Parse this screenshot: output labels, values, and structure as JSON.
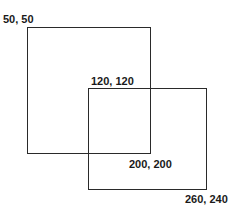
{
  "diagram": {
    "colors": {
      "stroke": "#2a2a2a",
      "text": "#1a1a1a",
      "background": "#ffffff"
    },
    "rectangles": [
      {
        "name": "rect-a",
        "top_left_label": "50, 50",
        "bottom_right_label": "200, 200",
        "box": {
          "left": 27,
          "top": 27,
          "width": 124,
          "height": 127
        }
      },
      {
        "name": "rect-b",
        "top_left_label": "120, 120",
        "bottom_right_label": "260, 240",
        "box": {
          "left": 88,
          "top": 88,
          "width": 119,
          "height": 102
        }
      }
    ],
    "labels": [
      {
        "text": "50, 50",
        "x": 3,
        "y": 13
      },
      {
        "text": "120, 120",
        "x": 91,
        "y": 75
      },
      {
        "text": "200, 200",
        "x": 129,
        "y": 158
      },
      {
        "text": "260, 240",
        "x": 185,
        "y": 193
      }
    ]
  }
}
